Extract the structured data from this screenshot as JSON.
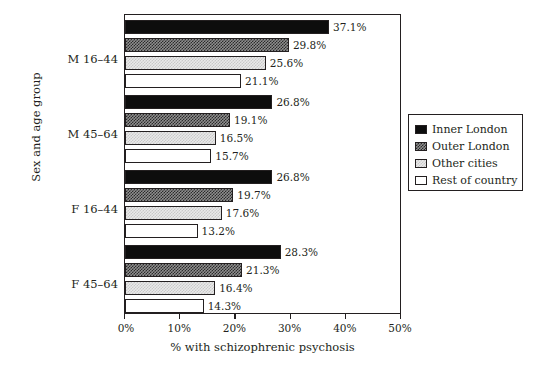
{
  "chart_data": {
    "type": "bar",
    "orientation": "horizontal",
    "title": "",
    "xlabel": "% with schizophrenic psychosis",
    "ylabel": "Sex and age group",
    "categories": [
      "M 16–44",
      "M 45–64",
      "F 16–44",
      "F 45–64"
    ],
    "series": [
      {
        "name": "Inner London",
        "values": [
          37.1,
          26.8,
          26.8,
          28.3
        ],
        "fill": "solid-black",
        "color": "#0d0d0d"
      },
      {
        "name": "Outer London",
        "values": [
          29.8,
          19.1,
          19.7,
          21.3
        ],
        "fill": "dark-checker",
        "color": "#8e8e8e"
      },
      {
        "name": "Other cities",
        "values": [
          25.6,
          16.5,
          17.6,
          16.4
        ],
        "fill": "light-checker",
        "color": "#e9e9e9"
      },
      {
        "name": "Rest of country",
        "values": [
          21.1,
          15.7,
          13.2,
          14.3
        ],
        "fill": "empty",
        "color": "#ffffff"
      }
    ],
    "data_labels": [
      [
        "37.1%",
        "29.8%",
        "25.6%",
        "21.1%"
      ],
      [
        "26.8%",
        "19.1%",
        "16.5%",
        "15.7%"
      ],
      [
        "26.8%",
        "19.7%",
        "17.6%",
        "13.2%"
      ],
      [
        "28.3%",
        "21.3%",
        "16.4%",
        "14.3%"
      ]
    ],
    "xlim": [
      0,
      50
    ],
    "xticks": [
      0,
      10,
      20,
      30,
      40,
      50
    ],
    "xticklabels": [
      "0%",
      "10%",
      "20%",
      "30%",
      "40%",
      "50%"
    ],
    "grid": false,
    "legend": {
      "position": "right",
      "entries": [
        "Inner London",
        "Outer London",
        "Other cities",
        "Rest of country"
      ]
    },
    "axis_color": "#231f20",
    "background": "#ffffff"
  }
}
